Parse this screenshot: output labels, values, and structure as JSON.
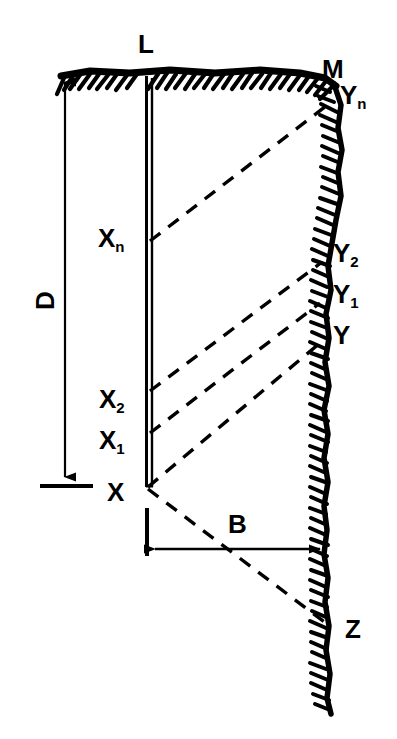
{
  "figure": {
    "type": "engineering-diagram",
    "colors": {
      "ink": "#000000",
      "background": "#ffffff"
    },
    "labels": {
      "pile_top": "L",
      "ground_right_corner": "M",
      "wedge_top_right": "Y",
      "wedge_top_right_sub": "n",
      "pile_depth_n": "X",
      "pile_depth_n_sub": "n",
      "pile_depth_2": "X",
      "pile_depth_2_sub": "2",
      "pile_depth_1": "X",
      "pile_depth_1_sub": "1",
      "pile_tip": "X",
      "soil_y2": "Y",
      "soil_y2_sub": "2",
      "soil_y1": "Y",
      "soil_y1_sub": "1",
      "soil_y": "Y",
      "depth_dimension": "D",
      "width_dimension": "B",
      "lower_wedge_point": "Z"
    },
    "geometry": {
      "pile_x_left": 145,
      "pile_x_right": 152,
      "pile_top_y": 76,
      "pile_tip_y": 487,
      "ground_line_y": 73,
      "ground_x_start": 62,
      "ground_x_end": 338,
      "depth_line_x": 65,
      "depth_arrow_top_y": 90,
      "depth_arrow_bottom_y": 485,
      "width_line_y": 549,
      "width_line_x_start": 147,
      "width_line_x_end": 327,
      "soil_edge_top_x": 340,
      "soil_edge_bottom_x": 330,
      "soil_edge_bottom_y": 712
    },
    "wedge_lines": [
      {
        "name": "line-xn-yn",
        "from_x": 150,
        "from_y": 241,
        "to_x": 330,
        "to_y": 103
      },
      {
        "name": "line-x2-y2",
        "from_x": 150,
        "from_y": 391,
        "to_x": 322,
        "to_y": 262
      },
      {
        "name": "line-x1-y1",
        "from_x": 150,
        "from_y": 433,
        "to_x": 320,
        "to_y": 303
      },
      {
        "name": "line-x-y",
        "from_x": 148,
        "from_y": 487,
        "to_x": 320,
        "to_y": 343
      },
      {
        "name": "line-x-z",
        "from_x": 148,
        "from_y": 489,
        "to_x": 331,
        "to_y": 627
      }
    ]
  }
}
